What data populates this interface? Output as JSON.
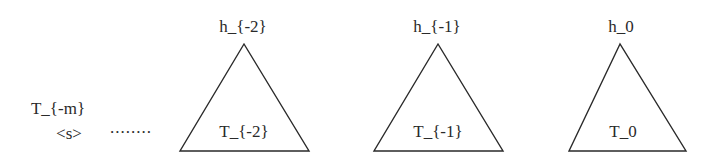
{
  "left": {
    "stack_label": "T_{-m}",
    "start_token": "<s>",
    "ellipsis": "........"
  },
  "trees": [
    {
      "head": "h_{-2}",
      "subtree": "T_{-2}"
    },
    {
      "head": "h_{-1}",
      "subtree": "T_{-1}"
    },
    {
      "head": "h_0",
      "subtree": "T_0"
    }
  ],
  "colors": {
    "stroke": "#2a2a2a",
    "background": "#ffffff"
  }
}
